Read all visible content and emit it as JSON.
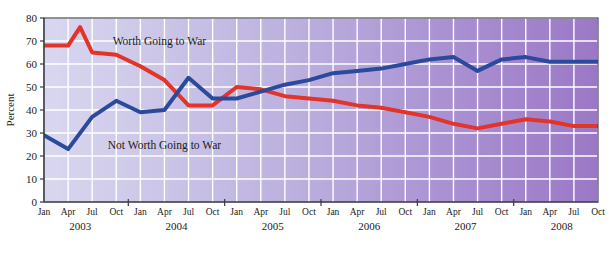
{
  "chart_data": {
    "type": "line",
    "title": "",
    "xlabel": "",
    "ylabel": "Percent",
    "ylim": [
      0,
      80
    ],
    "ytick_step": 10,
    "yticks": [
      0,
      10,
      20,
      30,
      40,
      50,
      60,
      70,
      80
    ],
    "grid": true,
    "legend_position": "inline-annotation",
    "x": [
      "Jan 2003",
      "Apr 2003",
      "Jul 2003",
      "Oct 2003",
      "Jan 2004",
      "Apr 2004",
      "Jul 2004",
      "Oct 2004",
      "Jan 2005",
      "Apr 2005",
      "Jul 2005",
      "Oct 2005",
      "Jan 2006",
      "Apr 2006",
      "Jul 2006",
      "Oct 2006",
      "Jan 2007",
      "Apr 2007",
      "Jul 2007",
      "Oct 2007",
      "Jan 2008",
      "Apr 2008",
      "Jul 2008",
      "Oct 2008"
    ],
    "xtick_labels": [
      "Jan",
      "Apr",
      "Jul",
      "Oct",
      "Jan",
      "Apr",
      "Jul",
      "Oct",
      "Jan",
      "Apr",
      "Jul",
      "Oct",
      "Jan",
      "Apr",
      "Jul",
      "Oct",
      "Jan",
      "Apr",
      "Jul",
      "Oct",
      "Jan",
      "Apr",
      "Jul",
      "Oct"
    ],
    "year_groups": [
      {
        "label": "2003",
        "start_index": 0,
        "end_index": 3
      },
      {
        "label": "2004",
        "start_index": 4,
        "end_index": 7
      },
      {
        "label": "2005",
        "start_index": 8,
        "end_index": 11
      },
      {
        "label": "2006",
        "start_index": 12,
        "end_index": 15
      },
      {
        "label": "2007",
        "start_index": 16,
        "end_index": 19
      },
      {
        "label": "2008",
        "start_index": 20,
        "end_index": 23
      }
    ],
    "series": [
      {
        "name": "Worth Going to War",
        "color": "#e23429",
        "label_x_index": 2.6,
        "label_y": 70,
        "values": [
          68,
          68,
          65,
          64,
          59,
          53,
          42,
          42,
          50,
          49,
          46,
          45,
          44,
          42,
          41,
          39,
          37,
          34,
          32,
          34,
          36,
          35,
          33,
          33
        ],
        "peak_note": {
          "between": "Apr 2003 and Jul 2003",
          "value": 76
        }
      },
      {
        "name": "Not Worth Going to War",
        "color": "#2b4a9b",
        "label_x_index": 2.4,
        "label_y": 25,
        "values": [
          29,
          23,
          37,
          44,
          39,
          40,
          54,
          45,
          45,
          48,
          51,
          53,
          56,
          57,
          58,
          60,
          62,
          63,
          57,
          62,
          63,
          61,
          61,
          61
        ],
        "dip_note": {
          "near": "Feb 2003",
          "value": 23
        }
      }
    ],
    "background": {
      "gradient_from": "#d7d5ee",
      "gradient_to": "#9d79c4",
      "gridline_color": "#ffffff"
    }
  }
}
